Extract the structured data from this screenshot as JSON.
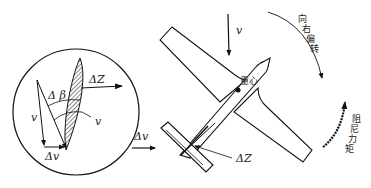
{
  "diagram": {
    "inset": {
      "labels": {
        "delta_z": "ΔZ",
        "delta_beta": "Δ β",
        "v_left": "v",
        "v_right": "v",
        "delta_v": "Δv"
      }
    },
    "main": {
      "labels": {
        "v_top": "v",
        "center_of_gravity": "重心",
        "delta_v": "Δv",
        "delta_z": "ΔZ",
        "yaw_right": [
          "向",
          "右",
          "偏",
          "转"
        ],
        "damping_moment": [
          "阻",
          "尼",
          "力",
          "矩"
        ]
      }
    },
    "colors": {
      "stroke": "#111111",
      "background": "#ffffff"
    }
  }
}
